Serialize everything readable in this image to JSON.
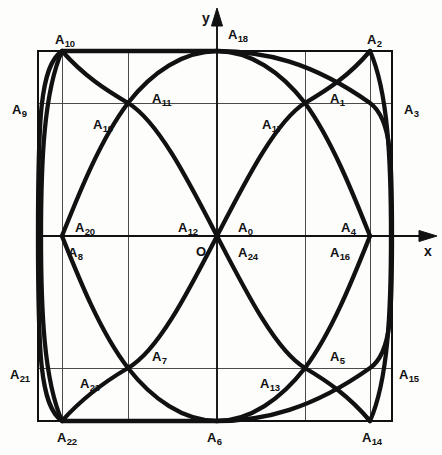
{
  "figure": {
    "background_color": "#fdfdfc",
    "stroke_color": "#111111",
    "grid_color": "#4a4a4a",
    "curve_width_px": 4.2,
    "grid_width_px": 1.0,
    "frame_width_px": 1.6
  },
  "axes": {
    "x_label": "x",
    "y_label": "y",
    "origin_label": "O",
    "x_axis_y_px": 236,
    "y_axis_x_px": 217,
    "x_axis_end_px": 437,
    "y_axis_end_px": 8
  },
  "frame": {
    "left_px": 38,
    "right_px": 392,
    "top_px": 51,
    "bottom_px": 421
  },
  "grid": {
    "vertical_x_px": [
      62,
      128,
      305,
      370
    ],
    "horizontal_y_px": [
      103,
      368
    ]
  },
  "chart_data": {
    "type": "scatter",
    "xlabel": "x",
    "ylabel": "y",
    "grid": true,
    "legend": "none",
    "xlim": [
      38,
      392
    ],
    "ylim": [
      51,
      421
    ],
    "curve_description": "Closed Lissajous-type figure inscribed in a rectangle, symmetric about both axes, passing through all 24 labelled division points",
    "points": [
      {
        "label": "A",
        "sub": "0",
        "x_px": 238,
        "y_px": 221,
        "anchor": "left"
      },
      {
        "label": "A",
        "sub": "1",
        "x_px": 330,
        "y_px": 92,
        "anchor": "left"
      },
      {
        "label": "A",
        "sub": "2",
        "x_px": 367,
        "y_px": 33,
        "anchor": "left"
      },
      {
        "label": "A",
        "sub": "3",
        "x_px": 404,
        "y_px": 103,
        "anchor": "left"
      },
      {
        "label": "A",
        "sub": "4",
        "x_px": 341,
        "y_px": 221,
        "anchor": "left"
      },
      {
        "label": "A",
        "sub": "5",
        "x_px": 330,
        "y_px": 350,
        "anchor": "left"
      },
      {
        "label": "A",
        "sub": "6",
        "x_px": 207,
        "y_px": 431,
        "anchor": "left"
      },
      {
        "label": "A",
        "sub": "7",
        "x_px": 152,
        "y_px": 350,
        "anchor": "left"
      },
      {
        "label": "A",
        "sub": "8",
        "x_px": 68,
        "y_px": 246,
        "anchor": "left"
      },
      {
        "label": "A",
        "sub": "9",
        "x_px": 12,
        "y_px": 103,
        "anchor": "left"
      },
      {
        "label": "A",
        "sub": "10",
        "x_px": 55,
        "y_px": 33,
        "anchor": "left"
      },
      {
        "label": "A",
        "sub": "11",
        "x_px": 152,
        "y_px": 92,
        "anchor": "left"
      },
      {
        "label": "A",
        "sub": "12",
        "x_px": 178,
        "y_px": 221,
        "anchor": "left"
      },
      {
        "label": "A",
        "sub": "13",
        "x_px": 260,
        "y_px": 377,
        "anchor": "left"
      },
      {
        "label": "A",
        "sub": "14",
        "x_px": 362,
        "y_px": 431,
        "anchor": "left"
      },
      {
        "label": "A",
        "sub": "15",
        "x_px": 399,
        "y_px": 368,
        "anchor": "left"
      },
      {
        "label": "A",
        "sub": "16",
        "x_px": 330,
        "y_px": 246,
        "anchor": "left"
      },
      {
        "label": "A",
        "sub": "17",
        "x_px": 262,
        "y_px": 118,
        "anchor": "left"
      },
      {
        "label": "A",
        "sub": "18",
        "x_px": 228,
        "y_px": 28,
        "anchor": "left"
      },
      {
        "label": "A",
        "sub": "19",
        "x_px": 93,
        "y_px": 118,
        "anchor": "left"
      },
      {
        "label": "A",
        "sub": "20",
        "x_px": 75,
        "y_px": 221,
        "anchor": "left"
      },
      {
        "label": "A",
        "sub": "21",
        "x_px": 10,
        "y_px": 368,
        "anchor": "left"
      },
      {
        "label": "A",
        "sub": "22",
        "x_px": 57,
        "y_px": 431,
        "anchor": "left"
      },
      {
        "label": "A",
        "sub": "23",
        "x_px": 80,
        "y_px": 377,
        "anchor": "left"
      },
      {
        "label": "A",
        "sub": "24",
        "x_px": 238,
        "y_px": 246,
        "anchor": "left"
      }
    ],
    "node_coordinates_px": [
      {
        "name": "top-left-node",
        "x": 62,
        "y": 51
      },
      {
        "name": "top-center-node",
        "x": 217,
        "y": 51
      },
      {
        "name": "top-right-node",
        "x": 370,
        "y": 51
      },
      {
        "name": "upper-left-cross",
        "x": 128,
        "y": 103
      },
      {
        "name": "upper-right-cross",
        "x": 305,
        "y": 103
      },
      {
        "name": "left-axis-node",
        "x": 62,
        "y": 236
      },
      {
        "name": "center-node",
        "x": 217,
        "y": 236
      },
      {
        "name": "right-axis-node",
        "x": 370,
        "y": 236
      },
      {
        "name": "lower-left-cross",
        "x": 128,
        "y": 368
      },
      {
        "name": "lower-right-cross",
        "x": 305,
        "y": 368
      },
      {
        "name": "bottom-left-node",
        "x": 62,
        "y": 421
      },
      {
        "name": "bottom-center-node",
        "x": 217,
        "y": 421
      },
      {
        "name": "bottom-right-node",
        "x": 370,
        "y": 421
      }
    ]
  }
}
